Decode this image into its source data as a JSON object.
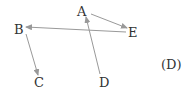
{
  "diagram": {
    "label": "(D)",
    "nodes": {
      "A": {
        "label": "A"
      },
      "B": {
        "label": "B"
      },
      "C": {
        "label": "C"
      },
      "D": {
        "label": "D"
      },
      "E": {
        "label": "E"
      }
    },
    "edges": [
      {
        "from": "A",
        "to": "E"
      },
      {
        "from": "E",
        "to": "B"
      },
      {
        "from": "B",
        "to": "C"
      },
      {
        "from": "D",
        "to": "A"
      }
    ],
    "colors": {
      "edge": "#999999",
      "text": "#333333"
    }
  }
}
